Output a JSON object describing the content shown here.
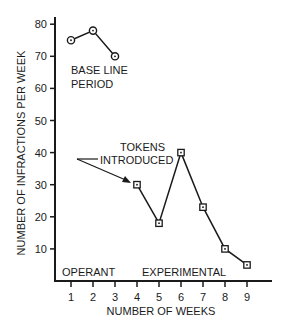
{
  "chart_data": {
    "type": "line",
    "title": "",
    "xlabel": "NUMBER OF WEEKS",
    "ylabel": "NUMBER OF INFRACTIONS PER WEEK",
    "xlim": [
      1,
      9
    ],
    "ylim": [
      0,
      80
    ],
    "x_ticks": [
      "1",
      "2",
      "3",
      "4",
      "5",
      "6",
      "7",
      "8",
      "9"
    ],
    "y_ticks": [
      "10",
      "20",
      "30",
      "40",
      "50",
      "60",
      "70",
      "80"
    ],
    "grid": false,
    "series": [
      {
        "name": "Base line period",
        "marker": "circle",
        "x": [
          1,
          2,
          3
        ],
        "values": [
          75,
          78,
          70
        ]
      },
      {
        "name": "Experimental (tokens)",
        "marker": "square",
        "x": [
          4,
          5,
          6,
          7,
          8,
          9
        ],
        "values": [
          30,
          18,
          40,
          23,
          10,
          5
        ]
      }
    ],
    "annotations": [
      {
        "text_line1": "BASE LINE",
        "text_line2": "PERIOD"
      },
      {
        "text_line1": "TOKENS",
        "text_line2": "INTRODUCED",
        "points_to_week": 4
      },
      {
        "text": "OPERANT"
      },
      {
        "text": "EXPERIMENTAL"
      }
    ]
  }
}
